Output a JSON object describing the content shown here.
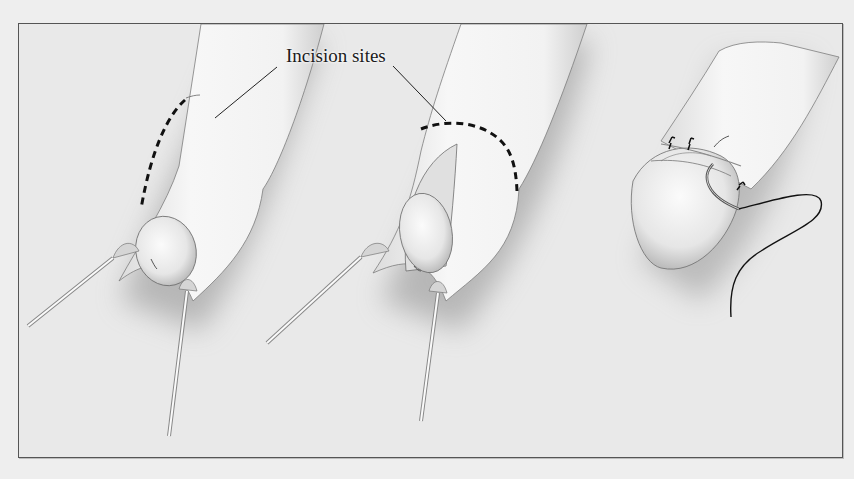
{
  "figure": {
    "panels": [
      {
        "id": "panel-1",
        "description": "Foreskin retracted behind glans with retraction probes; dorsal incision line marked"
      },
      {
        "id": "panel-2",
        "description": "Dorsal slit opened exposing glans; circumferential incision line marked"
      },
      {
        "id": "panel-3",
        "description": "Skin edges approximated with interrupted sutures; curved needle and suture thread"
      }
    ],
    "annotations": [
      {
        "text": "Incision sites",
        "points_to": [
          "panel-1",
          "panel-2"
        ]
      }
    ],
    "colors": {
      "background": "#e9e9e9",
      "frame": "#555555",
      "ink": "#1b1b1b",
      "skin": "#f3f3f3",
      "shadow": "#9a9a9a"
    }
  }
}
